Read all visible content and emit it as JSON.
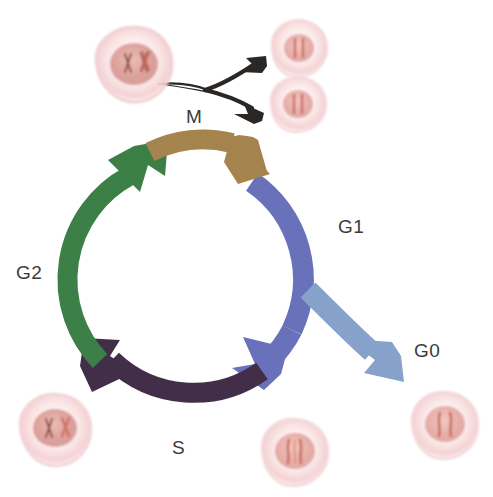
{
  "diagram": {
    "type": "cycle-diagram",
    "background_color": "#ffffff"
  },
  "labels": {
    "m": "M",
    "g1": "G1",
    "g2": "G2",
    "g0": "G0",
    "s": "S",
    "text_color": "#3a3a3c"
  },
  "phases": [
    {
      "id": "m",
      "label": "M",
      "color": "#a8864f",
      "position": "top",
      "direction": "clockwise",
      "description": "mitosis arc at top of cycle, tan arrow pointing right"
    },
    {
      "id": "g1",
      "label": "G1",
      "color": "#6a73bd",
      "position": "right",
      "direction": "clockwise",
      "description": "blue arc down right side, arrowhead at bottom"
    },
    {
      "id": "s",
      "label": "S",
      "color": "#43304a",
      "position": "bottom",
      "direction": "clockwise",
      "description": "dark purple arc along bottom, arrowhead at lower left"
    },
    {
      "id": "g2",
      "label": "G2",
      "color": "#3d8248",
      "position": "left",
      "direction": "clockwise",
      "description": "green arc up left side, arrowhead at top left"
    },
    {
      "id": "g0",
      "label": "G0",
      "color": "#89a5cf",
      "position": "lower-right-branch",
      "direction": "outward",
      "description": "light blue branch leaving G1 toward quiescent cell"
    }
  ],
  "mitosis_arrow": {
    "name": "splitting-arrow",
    "color": "#2a2724",
    "branches": 2,
    "description": "black forked arrow from parent cell to two daughter cells"
  },
  "cells": [
    {
      "id": "parent-cell-m",
      "label": "parent cell in mitosis",
      "position": "top-left",
      "chromosomes": "condensed duplicated X-shaped chromosomes",
      "membrane_color": "#f6dada",
      "nucleus_color": "#cf8b83"
    },
    {
      "id": "daughter-cell-upper",
      "label": "daughter cell",
      "position": "top-right-upper",
      "chromosomes": "single pair of chromosomes",
      "membrane_color": "#f8e2e2",
      "nucleus_color": "#e3a09b"
    },
    {
      "id": "daughter-cell-lower",
      "label": "daughter cell",
      "position": "top-right-lower",
      "chromosomes": "single pair of chromosomes",
      "membrane_color": "#f8e2e2",
      "nucleus_color": "#e3a09b"
    },
    {
      "id": "g2-cell",
      "label": "cell after DNA replication",
      "position": "bottom-left",
      "chromosomes": "duplicated X-shaped chromosomes",
      "membrane_color": "#f8e0e0",
      "nucleus_color": "#d9918a"
    },
    {
      "id": "s-cell",
      "label": "cell entering S phase",
      "position": "bottom-center",
      "chromosomes": "replicating chromosomes",
      "membrane_color": "#fae4e4",
      "nucleus_color": "#dda09a"
    },
    {
      "id": "g0-cell",
      "label": "quiescent cell",
      "position": "bottom-right",
      "chromosomes": "unreplicated chromosomes",
      "membrane_color": "#f9e3e3",
      "nucleus_color": "#dd9c96"
    }
  ]
}
